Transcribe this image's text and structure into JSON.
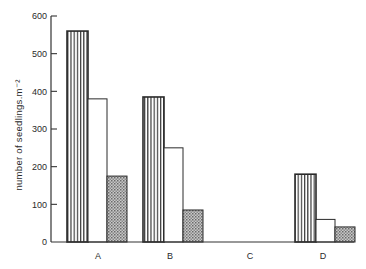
{
  "chart_data": {
    "type": "bar",
    "title": "",
    "xlabel": "",
    "ylabel": "number of seedlings.m⁻²",
    "categories": [
      "A",
      "B",
      "C",
      "D"
    ],
    "series": [
      {
        "name": "series 1 (vertical stripes)",
        "pattern": "vertical-stripes",
        "values": [
          560,
          385,
          0,
          180
        ]
      },
      {
        "name": "series 2 (open)",
        "pattern": "open",
        "values": [
          380,
          250,
          0,
          60
        ]
      },
      {
        "name": "series 3 (stippled)",
        "pattern": "stipple",
        "values": [
          175,
          85,
          0,
          40
        ]
      }
    ],
    "ylim": [
      0,
      600
    ],
    "yticks": [
      0,
      100,
      200,
      300,
      400,
      500,
      600
    ],
    "grid": false,
    "legend": "none"
  },
  "colors": {
    "axis": "#333333",
    "stripe": "#222222",
    "stipple": "#9a9a9a",
    "background": "#ffffff"
  }
}
